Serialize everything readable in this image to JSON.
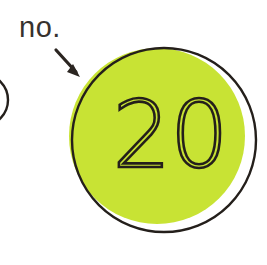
{
  "canvas": {
    "width": 267,
    "height": 265,
    "background_color": "#ffffff",
    "media": "scanned-print-page"
  },
  "annotation": {
    "label_text": "no.",
    "label_color": "#37322e",
    "arrow": {
      "name": "callout-arrow",
      "direction": "down-right",
      "start_x": 56,
      "start_y": 50,
      "end_x": 80,
      "end_y": 77,
      "color": "#2b2521",
      "head_style": "solid-triangle"
    }
  },
  "main_badge": {
    "name": "number-badge",
    "shape": "circle",
    "number_text": "20",
    "number_style": "thin-outline",
    "number_color": "#241f1b",
    "fill_color": "#c8e334",
    "outline_color": "#241f1b",
    "outline_width": 2.4,
    "outline_center_x": 164,
    "outline_center_y": 140,
    "outline_radius": 92,
    "fill_center_x": 157,
    "fill_center_y": 136,
    "fill_radius": 88,
    "registration_offset_note": "fill printed offset up-left of outline"
  },
  "secondary_badge": {
    "name": "adjacent-badge-clipped",
    "shape": "circle",
    "fill_color": "#c8e334",
    "outline_color": "#241f1b",
    "center_x": -18,
    "center_y": 100,
    "radius": 26,
    "clipped_edge": "left"
  },
  "palette": {
    "chartreuse": "#c8e334",
    "ink": "#241f1b",
    "paper": "#ffffff"
  }
}
